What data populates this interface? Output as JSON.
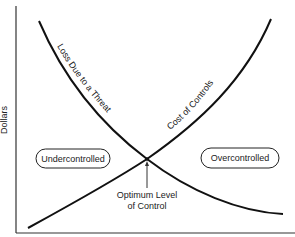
{
  "diagram": {
    "type": "cost-tradeoff-curves",
    "y_axis_label": "Dollars",
    "x_axis_label": "",
    "curves": [
      {
        "id": "loss",
        "label": "Loss Due to a Threat",
        "trend": "decreasing"
      },
      {
        "id": "cost",
        "label": "Cost of Controls",
        "trend": "increasing"
      }
    ],
    "regions": {
      "left": "Undercontrolled",
      "right": "Overcontrolled"
    },
    "intersection_label_line1": "Optimum Level",
    "intersection_label_line2": "of Control",
    "colors": {
      "line": "#111111",
      "axis": "#333333",
      "text": "#222222",
      "background": "#ffffff"
    }
  }
}
